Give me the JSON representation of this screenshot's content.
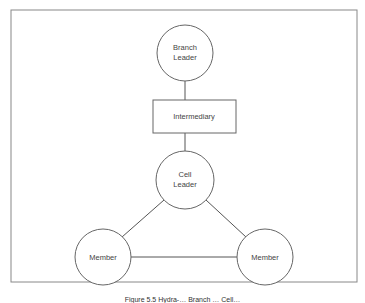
{
  "diagram": {
    "frame": {
      "x": 11,
      "y": 10,
      "width": 346,
      "height": 272,
      "stroke": "#888888"
    },
    "line_color": "#555555",
    "node_stroke": "#666666",
    "text_color": "#444444",
    "nodes": {
      "branch_leader": {
        "label_line1": "Branch",
        "label_line2": "Leader",
        "shape": "circle",
        "cx": 185,
        "cy": 53,
        "r": 28
      },
      "intermediary": {
        "label": "Intermediary",
        "shape": "rectangle",
        "x": 153,
        "y": 100,
        "width": 83,
        "height": 33
      },
      "cell_leader": {
        "label_line1": "Cell",
        "label_line2": "Leader",
        "shape": "circle",
        "cx": 185,
        "cy": 180,
        "r": 29
      },
      "member_left": {
        "label": "Member",
        "shape": "circle",
        "cx": 103,
        "cy": 257,
        "r": 28
      },
      "member_right": {
        "label": "Member",
        "shape": "circle",
        "cx": 265,
        "cy": 257,
        "r": 28
      }
    },
    "edges": [
      {
        "from": "branch_leader",
        "to": "intermediary"
      },
      {
        "from": "intermediary",
        "to": "cell_leader"
      },
      {
        "from": "cell_leader",
        "to": "member_left"
      },
      {
        "from": "cell_leader",
        "to": "member_right"
      },
      {
        "from": "member_left",
        "to": "member_right"
      }
    ]
  },
  "caption": {
    "text": "Figure 5.5 Hydra-… Branch … Cell…"
  }
}
